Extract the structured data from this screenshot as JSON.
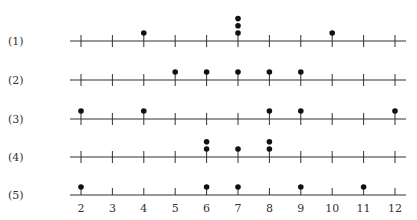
{
  "chart_data": {
    "type": "scatter",
    "subtype": "dot_plot",
    "title": "",
    "xlabel": "",
    "ylabel": "",
    "x_ticks": [
      2,
      3,
      4,
      5,
      6,
      7,
      8,
      9,
      10,
      11,
      12
    ],
    "xlim": [
      2,
      12
    ],
    "grid": false,
    "legend": null,
    "series": [
      {
        "name": "(1)",
        "values": [
          4,
          7,
          7,
          7,
          10
        ]
      },
      {
        "name": "(2)",
        "values": [
          5,
          6,
          7,
          8,
          9
        ]
      },
      {
        "name": "(3)",
        "values": [
          2,
          4,
          8,
          9,
          12
        ]
      },
      {
        "name": "(4)",
        "values": [
          6,
          6,
          7,
          8,
          8
        ]
      },
      {
        "name": "(5)",
        "values": [
          2,
          6,
          7,
          9,
          11
        ]
      }
    ]
  },
  "colors": {
    "axis": "#333333",
    "dot": "#111111",
    "background": "#ffffff"
  }
}
